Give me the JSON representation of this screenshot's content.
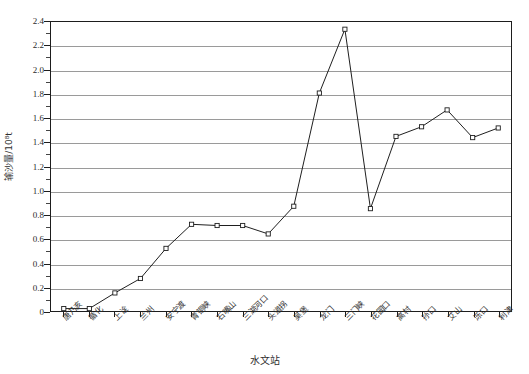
{
  "chart_data": {
    "type": "line",
    "title": "",
    "xlabel": "水文站",
    "ylabel": "输沙量/10⁸t",
    "categories": [
      "唐乃亥",
      "循化",
      "上诠",
      "兰州",
      "安宁渡",
      "青铜峡",
      "石嘴山",
      "三湖河口",
      "头道拐",
      "吴堡",
      "龙门",
      "三门峡",
      "花园口",
      "高村",
      "孙口",
      "艾山",
      "泺口",
      "利津"
    ],
    "values": [
      0.02,
      0.02,
      0.15,
      0.27,
      0.52,
      0.72,
      0.71,
      0.71,
      0.64,
      0.87,
      1.81,
      2.34,
      0.85,
      1.45,
      1.53,
      1.67,
      1.44,
      1.52
    ],
    "series": [
      {
        "name": "输沙量",
        "values": [
          0.02,
          0.02,
          0.15,
          0.27,
          0.52,
          0.72,
          0.71,
          0.71,
          0.64,
          0.87,
          1.81,
          2.34,
          0.85,
          1.45,
          1.53,
          1.67,
          1.44,
          1.52
        ]
      }
    ],
    "ylim": [
      0,
      2.4
    ],
    "ytick_values": [
      0,
      0.2,
      0.4,
      0.6,
      0.8,
      1.0,
      1.2,
      1.4,
      1.6,
      1.8,
      2.0,
      2.2,
      2.4
    ],
    "ytick_labels": [
      "0",
      "0.2",
      "0.4",
      "0.6",
      "0.8",
      "1.0",
      "1.2",
      "1.4",
      "1.6",
      "1.8",
      "2.0",
      "2.2",
      "2.4"
    ],
    "grid": true,
    "grid_orientation": "horizontal",
    "legend": false,
    "legend_position": "none",
    "marker": "open-square",
    "line_color": "#1d1d1d",
    "marker_fill": "#ffffff",
    "marker_edge": "#1d1d1d",
    "grid_color": "#9a9a9a",
    "axis_color": "#1d1d1d",
    "background_color": "#ffffff"
  }
}
